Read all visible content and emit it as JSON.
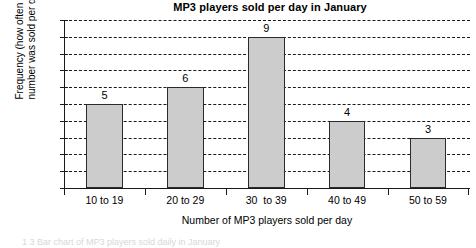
{
  "chart_data": {
    "type": "bar",
    "title": "MP3 players sold per day in January",
    "xlabel": "Number of MP3 players sold per day",
    "ylabel_lines": [
      "Frequency (how often this",
      "number was sold per day)"
    ],
    "ylabel": "Frequency (how often this number was sold per day)",
    "categories": [
      "10 to 19",
      "20 to 29",
      "30  to 39",
      "40 to 49",
      "50 to 59"
    ],
    "values": [
      5,
      6,
      9,
      4,
      3
    ],
    "value_labels": [
      "5",
      "6",
      "9",
      "4",
      "3"
    ],
    "ylim": [
      0,
      10
    ],
    "ytick_step": 1,
    "yticks": [
      "0",
      "1",
      "2",
      "3",
      "4",
      "5",
      "6",
      "7",
      "8",
      "9",
      "10"
    ],
    "grid": true,
    "grid_style": "dashed-horizontal",
    "legend": "none",
    "bar_fill_color": "#cccccc",
    "bar_border_color": "#2b2b2b",
    "axis_color": "#1a1a1a",
    "text_color": "#000000"
  },
  "bottom_caption": {
    "text": "1 3   Bar chart of MP3 players sold daily in January"
  }
}
